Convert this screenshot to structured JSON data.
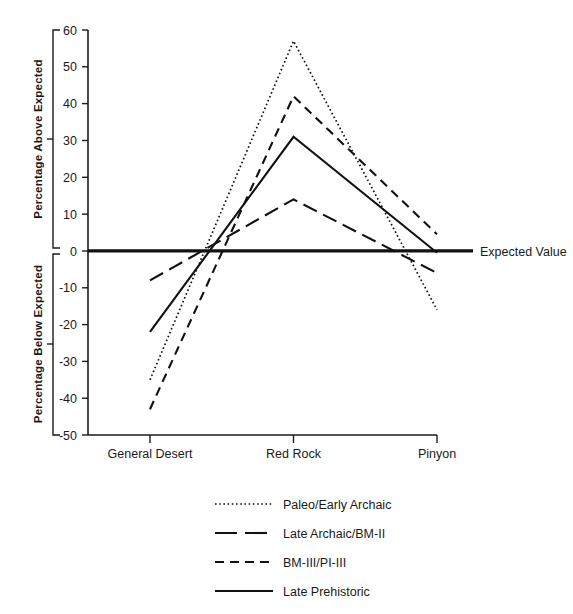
{
  "chart_data": {
    "type": "line",
    "title": "",
    "subtitle": "",
    "xlabel": "",
    "ylabel_upper": "Percentage Above Expected",
    "ylabel_lower": "Percentage Below Expected",
    "categories": [
      "General Desert",
      "Red Rock",
      "Pinyon"
    ],
    "ylim": [
      -50,
      60
    ],
    "yticks": [
      60,
      50,
      40,
      30,
      20,
      10,
      0,
      -10,
      -20,
      -30,
      -40,
      -50
    ],
    "ytick_labels": [
      "60",
      "50",
      "40",
      "30",
      "20",
      "10",
      "0",
      "-10",
      "-20",
      "-30",
      "-40",
      "-50"
    ],
    "grid": false,
    "legend_position": "below",
    "reference_line": {
      "value": 0,
      "label": "Expected Value"
    },
    "series": [
      {
        "name": "Paleo/Early Archaic",
        "style": "dotted",
        "values": [
          -35,
          57,
          -16
        ]
      },
      {
        "name": "Late Archaic/BM-II",
        "style": "long-dash",
        "values": [
          -8,
          14,
          -6
        ]
      },
      {
        "name": "BM-III/PI-III",
        "style": "dashed",
        "values": [
          -43,
          42,
          4.5
        ]
      },
      {
        "name": "Late Prehistoric",
        "style": "solid",
        "values": [
          -22,
          31,
          -0.5
        ]
      }
    ]
  },
  "axis": {
    "upper_bracket_label": "Percentage Above Expected",
    "lower_bracket_label": "Percentage Below Expected",
    "tick_60": "60",
    "tick_50": "50",
    "tick_40": "40",
    "tick_30": "30",
    "tick_20": "20",
    "tick_10": "10",
    "tick_0": "0",
    "tick_m10": "-10",
    "tick_m20": "-20",
    "tick_m30": "-30",
    "tick_m40": "-40",
    "tick_m50": "-50"
  },
  "categories": {
    "c0": "General Desert",
    "c1": "Red Rock",
    "c2": "Pinyon"
  },
  "annotations": {
    "expected_value": "Expected Value"
  },
  "legend": {
    "items": [
      {
        "label": "Paleo/Early Archaic",
        "style": "dotted"
      },
      {
        "label": "Late Archaic/BM-II",
        "style": "long-dash"
      },
      {
        "label": "BM-III/PI-III",
        "style": "dashed"
      },
      {
        "label": "Late Prehistoric",
        "style": "solid"
      }
    ]
  },
  "colors": {
    "ink": "#111111",
    "background": "#ffffff"
  }
}
